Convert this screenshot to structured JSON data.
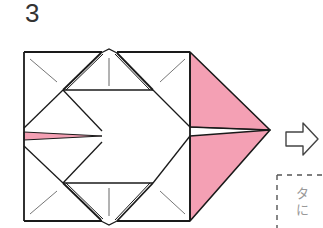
{
  "step": {
    "number": "3"
  },
  "diagram": {
    "colors": {
      "paper_front": "#ffffff",
      "paper_back": "#f4a0b4",
      "line": "#1a1a1a",
      "crease": "#555555",
      "arrow_outline": "#444444",
      "dashed_box": "#555555"
    },
    "next_arrow": "hollow-right-arrow"
  },
  "note": {
    "line1": "タ",
    "line2": "に"
  }
}
